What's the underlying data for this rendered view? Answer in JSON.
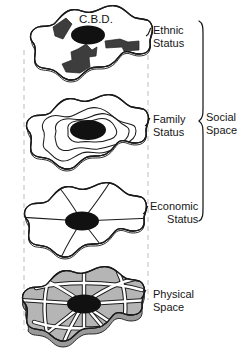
{
  "figure": {
    "cbd_label": "C.B.D.",
    "group_bracket_label": "Social\nSpace",
    "background_color": "#ffffff",
    "ink_color": "#1a1a1a",
    "guide_color": "#bdbdbd"
  },
  "layers": [
    {
      "id": "ethnic",
      "label": "Ethnic\nStatus",
      "pattern": "clustered patches",
      "fill": "#ffffff",
      "marker_fill": "#3a3a3a",
      "has_cbd": true
    },
    {
      "id": "family",
      "label": "Family\nStatus",
      "pattern": "concentric zones",
      "fill": "#ffffff",
      "marker_fill": "#111111",
      "has_cbd": true
    },
    {
      "id": "economic",
      "label": "Economic\nStatus",
      "pattern": "radial sectors",
      "fill": "#ffffff",
      "marker_fill": "#111111",
      "has_cbd": true
    },
    {
      "id": "physical",
      "label": "Physical\nSpace",
      "pattern": "street network",
      "fill": "#b3b3b3",
      "marker_fill": "#111111",
      "has_cbd": true
    }
  ],
  "brackets": [
    {
      "id": "social-space",
      "label": "Social\nSpace",
      "spans": [
        "ethnic",
        "family",
        "economic"
      ]
    }
  ],
  "guides": {
    "left_dashed": true,
    "right_dashed": true,
    "style": "dashed vertical projection lines"
  }
}
